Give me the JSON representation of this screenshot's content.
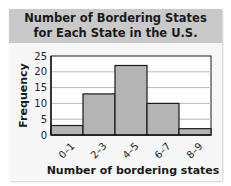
{
  "chart_data": {
    "type": "bar",
    "title_lines": [
      "Number of Bordering States",
      "for Each State in the U.S."
    ],
    "categories": [
      "0–1",
      "2–3",
      "4–5",
      "6–7",
      "8–9"
    ],
    "values": [
      3,
      13,
      22,
      10,
      2
    ],
    "xlabel": "Number of bordering states",
    "ylabel": "Frequency",
    "ylim": [
      0,
      25
    ],
    "yticks": [
      0,
      5,
      10,
      15,
      20,
      25
    ],
    "grid": true,
    "histogram": true,
    "colors": {
      "bar": "#b4b4b4",
      "bar_edge": "#1a1a1a",
      "grid": "#b8b8b8",
      "title_band": "#c9c9c9"
    }
  }
}
